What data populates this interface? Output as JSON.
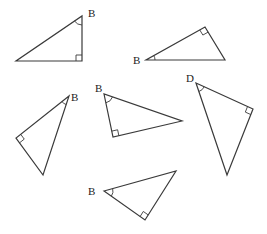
{
  "diagram": {
    "title": "",
    "colors": {
      "stroke": "#3a3a3a",
      "label": "#222222",
      "background": "#ffffff"
    },
    "triangles": [
      {
        "id": "t1",
        "vertex_label": "B",
        "label_pos": [
          88,
          17
        ],
        "points": [
          [
            16,
            61
          ],
          [
            82,
            61
          ],
          [
            82,
            16
          ]
        ],
        "angle_vertex": [
          82,
          16
        ],
        "right_vertex": [
          82,
          61
        ]
      },
      {
        "id": "t2",
        "vertex_label": "B",
        "label_pos": [
          133,
          64
        ],
        "points": [
          [
            146,
            60
          ],
          [
            225,
            60
          ],
          [
            205,
            27
          ]
        ],
        "angle_vertex": [
          146,
          60
        ],
        "right_vertex": [
          205,
          27
        ]
      },
      {
        "id": "t3",
        "vertex_label": "B",
        "label_pos": [
          71,
          101
        ],
        "points": [
          [
            69,
            96
          ],
          [
            16,
            138
          ],
          [
            43,
            175
          ]
        ],
        "angle_vertex": [
          69,
          96
        ],
        "right_vertex": [
          16,
          138
        ]
      },
      {
        "id": "t4",
        "vertex_label": "B",
        "label_pos": [
          95,
          92
        ],
        "points": [
          [
            104,
            94
          ],
          [
            113,
            137
          ],
          [
            182,
            121
          ]
        ],
        "angle_vertex": [
          104,
          94
        ],
        "right_vertex": [
          113,
          137
        ]
      },
      {
        "id": "t5",
        "vertex_label": "D",
        "label_pos": [
          186,
          82
        ],
        "points": [
          [
            196,
            83
          ],
          [
            253,
            109
          ],
          [
            227,
            175
          ]
        ],
        "angle_vertex": [
          196,
          83
        ],
        "right_vertex": [
          253,
          109
        ]
      },
      {
        "id": "t6",
        "vertex_label": "B",
        "label_pos": [
          88,
          195
        ],
        "points": [
          [
            104,
            191
          ],
          [
            176,
            171
          ],
          [
            145,
            220
          ]
        ],
        "angle_vertex": [
          104,
          191
        ],
        "right_vertex": [
          145,
          220
        ]
      }
    ]
  }
}
